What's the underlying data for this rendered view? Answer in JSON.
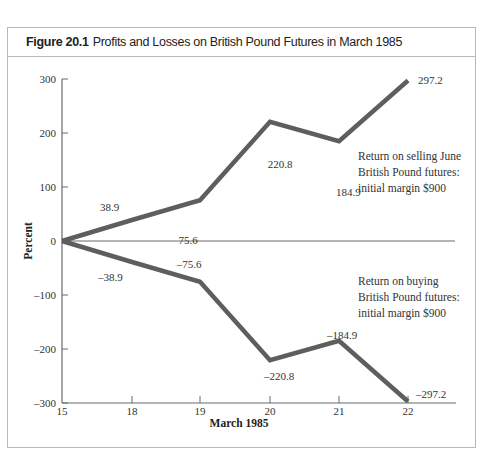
{
  "figure": {
    "number": "Figure 20.1",
    "title": "Profits and Losses on British Pound Futures in March 1985"
  },
  "chart_data": {
    "type": "line",
    "title": "Profits and Losses on British Pound Futures in March 1985",
    "xlabel": "March 1985",
    "ylabel": "Percent",
    "x": [
      15,
      18,
      19,
      20,
      21,
      22
    ],
    "x_tick_labels": [
      "15",
      "18",
      "19",
      "20",
      "21",
      "22"
    ],
    "y_tick_labels": [
      "300",
      "200",
      "100",
      "0",
      "-100",
      "-200",
      "-300"
    ],
    "ylim": [
      -300,
      300
    ],
    "grid": false,
    "series": [
      {
        "name": "Return on selling June British Pound futures: initial margin $900",
        "values": [
          0,
          38.9,
          75.6,
          220.8,
          184.9,
          297.2
        ],
        "labels": [
          "",
          "38.9",
          "75.6",
          "220.8",
          "184.9",
          "297.2"
        ]
      },
      {
        "name": "Return on buying British Pound futures: initial margin $900",
        "values": [
          0,
          -38.9,
          -75.6,
          -220.8,
          -184.9,
          -297.2
        ],
        "labels": [
          "",
          "–38.9",
          "–75.6",
          "–220.8",
          "–184.9",
          "–297.2"
        ]
      }
    ],
    "annotations": [
      [
        "Return on selling June",
        "British Pound futures:",
        "initial margin $900"
      ],
      [
        "Return on buying",
        "British Pound futures:",
        "initial margin $900"
      ]
    ],
    "line_color": "#5e5e5e"
  }
}
